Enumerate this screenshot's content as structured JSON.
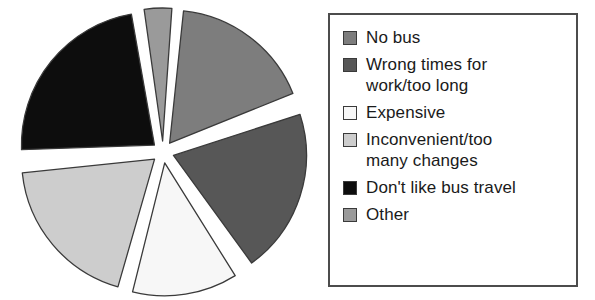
{
  "chart_data": {
    "type": "pie",
    "title": "",
    "subtitle": "",
    "xlabel": "",
    "ylabel": "",
    "exploded": true,
    "legend_position": "right",
    "grid": false,
    "categories": [
      "No bus",
      "Wrong times for work/too long",
      "Expensive",
      "Inconvenient/too many changes",
      "Don't like bus travel",
      "Other"
    ],
    "values": [
      17,
      20,
      13,
      19,
      23,
      3
    ],
    "units": "percent",
    "slices": [
      {
        "label": "No bus",
        "value": 17,
        "color": "#7d7d7d",
        "start_angle": 6,
        "end_angle": 68
      },
      {
        "label": "Wrong times for work/too long",
        "value": 20,
        "color": "#575757",
        "start_angle": 72,
        "end_angle": 144
      },
      {
        "label": "Expensive",
        "value": 13,
        "color": "#f7f7f7",
        "start_angle": 148,
        "end_angle": 194
      },
      {
        "label": "Inconvenient/too many changes",
        "value": 19,
        "color": "#cdcdcd",
        "start_angle": 196,
        "end_angle": 264
      },
      {
        "label": "Don't like bus travel",
        "value": 23,
        "color": "#0d0d0d",
        "start_angle": 268,
        "end_angle": 350
      },
      {
        "label": "Other",
        "value": 3,
        "color": "#9a9a9a",
        "start_angle": 352,
        "end_angle": 364
      }
    ]
  },
  "legend": {
    "border_color": "#4c4c4c",
    "background": "#ffffff",
    "items": [
      {
        "label": "No bus",
        "color": "#7d7d7d"
      },
      {
        "label": "Wrong times for\nwork/too long",
        "color": "#575757"
      },
      {
        "label": "Expensive",
        "color": "#f7f7f7"
      },
      {
        "label": "Inconvenient/too\nmany changes",
        "color": "#cdcdcd"
      },
      {
        "label": "Don't like bus travel",
        "color": "#0d0d0d"
      },
      {
        "label": "Other",
        "color": "#9a9a9a"
      }
    ]
  }
}
